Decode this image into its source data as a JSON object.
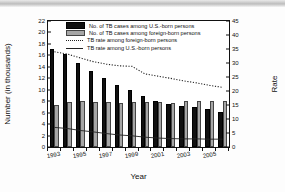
{
  "chart_data": {
    "type": "bar",
    "title": "",
    "xlabel": "Year",
    "ylabel": "Number (in thousands)",
    "y2label": "Rate",
    "ylim": [
      0,
      22
    ],
    "y2lim": [
      0,
      45
    ],
    "grid": false,
    "legend_position": "top-center",
    "categories": [
      "1993",
      "1994",
      "1995",
      "1996",
      "1997",
      "1998",
      "1999",
      "2000",
      "2001",
      "2002",
      "2003",
      "2004",
      "2005",
      "2006"
    ],
    "x_tick_labels": [
      "1993",
      "1995",
      "1997",
      "1999",
      "2001",
      "2003",
      "2005"
    ],
    "y_tick_labels": [
      "0",
      "2",
      "4",
      "6",
      "8",
      "10",
      "12",
      "14",
      "16",
      "18",
      "20",
      "22"
    ],
    "y2_tick_labels": [
      "0",
      "5",
      "10",
      "15",
      "20",
      "25",
      "30",
      "35",
      "40",
      "45"
    ],
    "series": [
      {
        "name": "No. of TB cases among U.S.-born persons",
        "kind": "bar",
        "color": "#101010",
        "axis": "left",
        "values": [
          17.1,
          16.2,
          14.6,
          13.3,
          12.0,
          10.8,
          10.0,
          8.9,
          8.1,
          7.5,
          7.1,
          7.0,
          6.6,
          6.2
        ]
      },
      {
        "name": "No. of TB cases among foreign-born persons",
        "kind": "bar",
        "color": "#a6a6a6",
        "axis": "left",
        "values": [
          7.4,
          7.8,
          8.1,
          7.8,
          7.9,
          7.7,
          7.8,
          7.8,
          7.9,
          7.6,
          8.1,
          8.0,
          8.0,
          8.1
        ]
      },
      {
        "name": "TB rate among foreign-born persons",
        "kind": "dotted-line",
        "color": "#222222",
        "axis": "right",
        "values": [
          34.0,
          33.2,
          31.8,
          30.5,
          29.6,
          29.0,
          28.8,
          26.1,
          25.3,
          24.5,
          23.6,
          22.9,
          22.0,
          21.3
        ]
      },
      {
        "name": "TB rate among U.S.-born persons",
        "kind": "solid-line",
        "color": "#222222",
        "axis": "right",
        "values": [
          7.0,
          6.6,
          5.9,
          5.4,
          4.8,
          4.3,
          4.0,
          3.5,
          3.2,
          3.0,
          2.9,
          2.9,
          2.8,
          2.8
        ]
      }
    ]
  }
}
